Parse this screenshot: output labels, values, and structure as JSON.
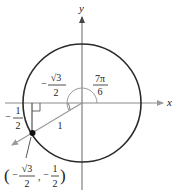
{
  "diagram": {
    "type": "unit-circle",
    "axes": {
      "x_label": "x",
      "y_label": "y"
    },
    "angle": {
      "num": "7π",
      "den": "6"
    },
    "radius_label": "1",
    "x_component": {
      "sign": "−",
      "num": "√3",
      "den": "2"
    },
    "y_component": {
      "sign": "−",
      "num": "1",
      "den": "2"
    },
    "point": {
      "open": "(",
      "x_sign": "−",
      "x_num": "√3",
      "x_den": "2",
      "sep": ",",
      "y_sign": "−",
      "y_num": "1",
      "y_den": "2",
      "close": ")"
    },
    "colors": {
      "circle": "#2a2a2a",
      "axes": "#8a8a8a",
      "ray": "#9a9a9a",
      "point": "#111111",
      "text": "#222222"
    }
  }
}
